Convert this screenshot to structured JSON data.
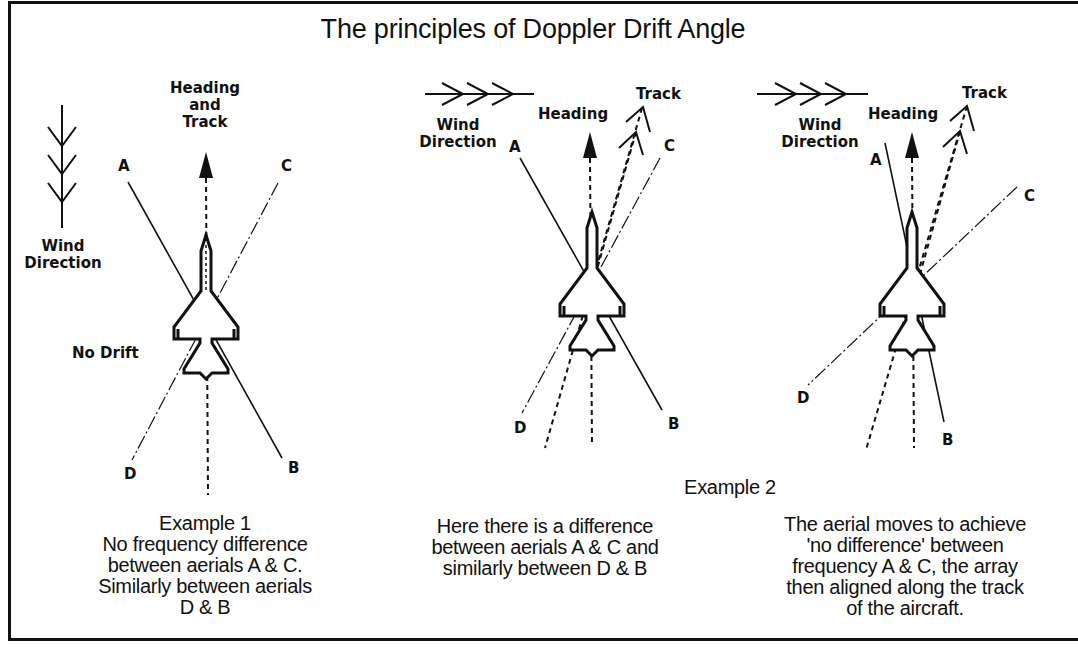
{
  "title": "The principles of Doppler Drift Angle",
  "example1": {
    "labels": {
      "heading": "Heading\nand\nTrack",
      "wind": "Wind\nDirection",
      "no_drift": "No Drift",
      "A": "A",
      "B": "B",
      "C": "C",
      "D": "D"
    },
    "caption_title": "Example 1",
    "caption": "No frequency difference\nbetween aerials A & C.\nSimilarly between aerials\nD & B"
  },
  "example2_header": "Example 2",
  "example2a": {
    "labels": {
      "wind": "Wind\nDirection",
      "heading": "Heading",
      "track": "Track",
      "A": "A",
      "B": "B",
      "C": "C",
      "D": "D"
    },
    "caption": "Here there is a difference\nbetween aerials A & C and\nsimilarly between D & B"
  },
  "example2b": {
    "labels": {
      "wind": "Wind\nDirection",
      "heading": "Heading",
      "track": "Track",
      "A": "A",
      "B": "B",
      "C": "C",
      "D": "D"
    },
    "caption": "The aerial moves to achieve\n'no difference' between\nfrequency A & C, the array\nthen aligned along the track\nof the aircraft."
  },
  "icons": {
    "wind_arrow": "chevron-feathered-arrow",
    "heading_arrow": "solid-triangle-arrow",
    "track_arrow": "open-chevron-arrow",
    "aircraft": "delta-wing-jet"
  }
}
